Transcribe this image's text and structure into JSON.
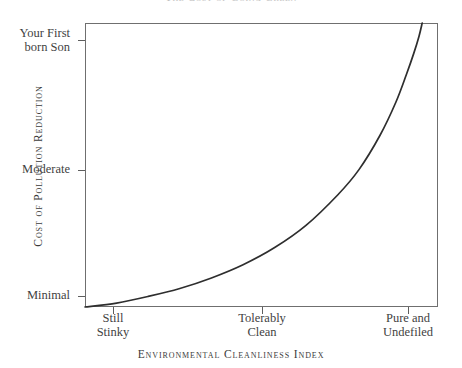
{
  "figure": {
    "title_remnant": "The Cost of Going Green",
    "background_color": "#ffffff",
    "ink_color": "#3a3a3a",
    "frame_color": "#6f6f6f"
  },
  "chart_data": {
    "type": "line",
    "title": "",
    "xlabel": "Environmental Cleanliness Index",
    "ylabel": "Cost of Pollution Reduction",
    "grid": false,
    "legend": false,
    "x_tick_labels": [
      "Still Stinky",
      "Tolerably Clean",
      "Pure and Undefiled"
    ],
    "x_tick_values": [
      1,
      2,
      3
    ],
    "y_tick_labels": [
      "Minimal",
      "Moderate",
      "Your First born Son"
    ],
    "y_tick_values": [
      0,
      1,
      2
    ],
    "xlim": [
      0.0,
      3.35
    ],
    "ylim": [
      0.0,
      2.15
    ],
    "series": [
      {
        "name": "Marginal cost of pollution reduction",
        "x": [
          0.0,
          0.3,
          0.6,
          0.9,
          1.2,
          1.5,
          1.8,
          2.1,
          2.4,
          2.6,
          2.8,
          2.95,
          3.05,
          3.12,
          3.17,
          3.2
        ],
        "y": [
          0.0,
          0.03,
          0.08,
          0.14,
          0.22,
          0.32,
          0.45,
          0.62,
          0.85,
          1.04,
          1.3,
          1.55,
          1.76,
          1.92,
          2.05,
          2.15
        ]
      }
    ],
    "annotations": []
  },
  "axes": {
    "y_ticks": [
      {
        "label": "Your First\nborn Son",
        "name": "y-tick-firstborn"
      },
      {
        "label": "Moderate",
        "name": "y-tick-moderate"
      },
      {
        "label": "Minimal",
        "name": "y-tick-minimal"
      }
    ],
    "x_ticks": [
      {
        "label": "Still\nStinky",
        "name": "x-tick-still-stinky"
      },
      {
        "label": "Tolerably\nClean",
        "name": "x-tick-tolerably-clean"
      },
      {
        "label": "Pure and\nUndefiled",
        "name": "x-tick-pure-undefiled"
      }
    ],
    "y_axis_title": "Cost of Pollution Reduction",
    "x_axis_title": "Environmental Cleanliness Index"
  }
}
